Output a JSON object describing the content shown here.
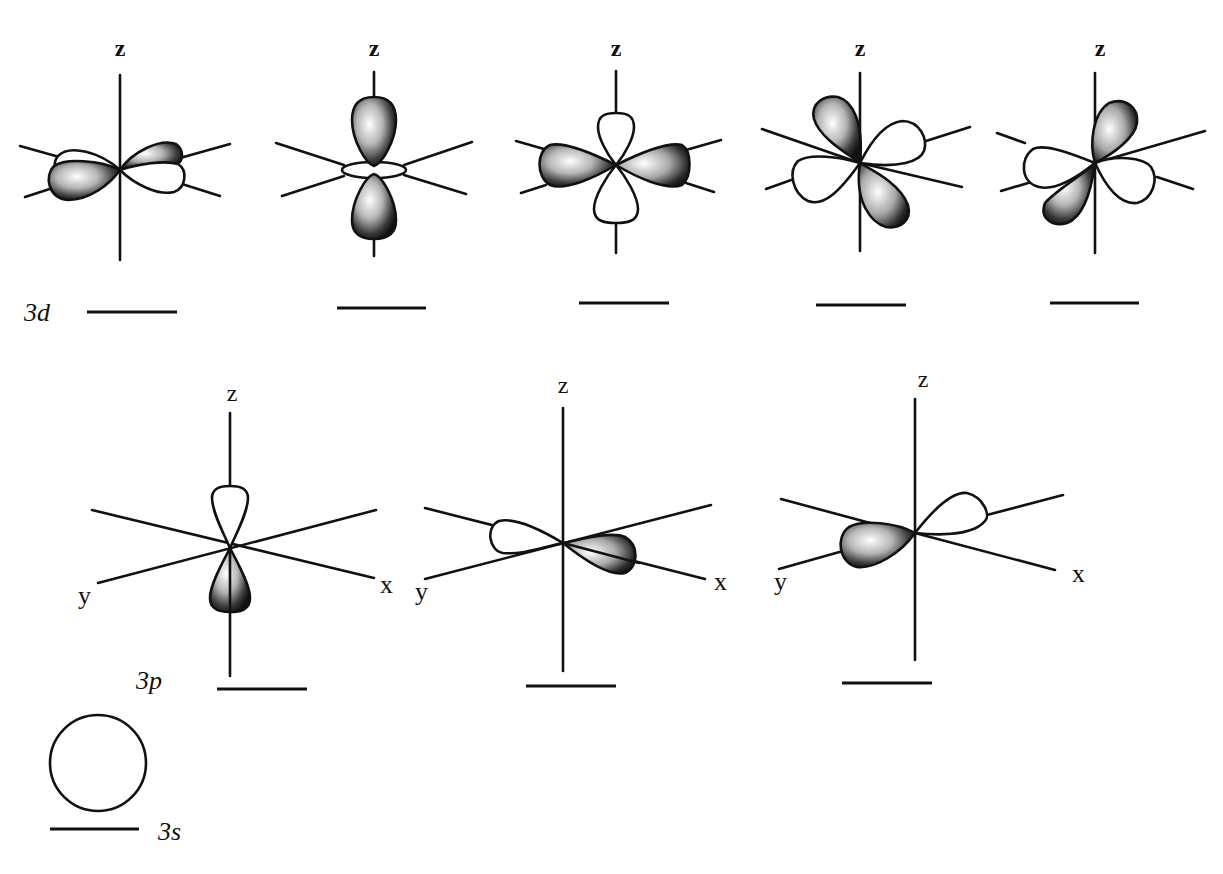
{
  "figure": {
    "shell_n": 3
  },
  "axis_labels": {
    "z": "z",
    "x": "x",
    "y": "y"
  },
  "sublevels": {
    "d": {
      "label": "3d",
      "orbital_count": 5,
      "orbitals": [
        {
          "id": "d1",
          "axis_label": "z",
          "shading": "lobes in x-y plane, alternating phase"
        },
        {
          "id": "d2",
          "axis_label": "z",
          "shading": "dz2: two shaded lobes along z with torus"
        },
        {
          "id": "d3",
          "axis_label": "z",
          "shading": "in-plane shaded lobes, open lobes along z"
        },
        {
          "id": "d4",
          "axis_label": "z",
          "shading": "diagonal lobes, upper-left & lower-right shaded"
        },
        {
          "id": "d5",
          "axis_label": "z",
          "shading": "diagonal lobes, upper-right & lower-left shaded"
        }
      ]
    },
    "p": {
      "label": "3p",
      "orbital_count": 3,
      "orbitals": [
        {
          "id": "pz",
          "axis_labels": [
            "z",
            "y",
            "x"
          ],
          "shading": "lower lobe shaded"
        },
        {
          "id": "px",
          "axis_labels": [
            "z",
            "y",
            "x"
          ],
          "shading": "x-side lobe shaded"
        },
        {
          "id": "py",
          "axis_labels": [
            "z",
            "y",
            "x"
          ],
          "shading": "y-side lobe shaded"
        }
      ]
    },
    "s": {
      "label": "3s",
      "orbital_count": 1,
      "orbitals": [
        {
          "id": "s",
          "shape": "sphere"
        }
      ]
    }
  },
  "colors": {
    "ink": "#111111",
    "background": "#ffffff",
    "shade_light": "#f4f4f4",
    "shade_dark": "#111111"
  }
}
